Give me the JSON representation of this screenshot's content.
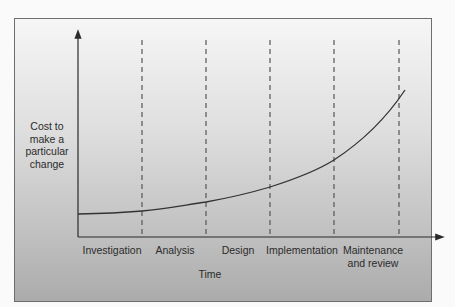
{
  "diagram": {
    "y_axis_label_lines": [
      "Cost to",
      "make a",
      "particular",
      "change"
    ],
    "x_axis_title": "Time",
    "phases": [
      {
        "label_lines": [
          "Investigation"
        ]
      },
      {
        "label_lines": [
          "Analysis"
        ]
      },
      {
        "label_lines": [
          "Design"
        ]
      },
      {
        "label_lines": [
          "Implementation"
        ]
      },
      {
        "label_lines": [
          "Maintenance",
          "and review"
        ]
      }
    ],
    "curve_description": "Cost to make a change rises exponentially over time",
    "colors": {
      "border": "#6e6e6e",
      "axis": "#2b2b2b",
      "dashed": "#555555",
      "curve": "#333333",
      "gradient_top": "#f6f6f6",
      "gradient_bottom": "#ababab"
    }
  }
}
